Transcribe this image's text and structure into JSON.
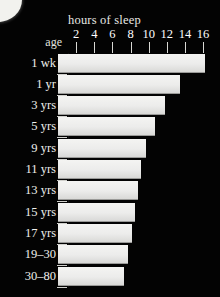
{
  "figure": {
    "title": "hours of sleep",
    "age_axis_label": "age"
  },
  "chart_data": {
    "type": "bar",
    "orientation": "horizontal",
    "title": "hours of sleep",
    "xlabel": "hours of sleep",
    "ylabel": "age",
    "xlim": [
      0,
      17
    ],
    "xticks": [
      2,
      4,
      6,
      8,
      10,
      12,
      14,
      16
    ],
    "xtick_labels": [
      "2",
      "4",
      "6",
      "8",
      "10",
      "12",
      "14",
      "16"
    ],
    "grid": false,
    "legend": "none",
    "categories": [
      "1 wk",
      "1 yr",
      "3 yrs",
      "5 yrs",
      "9 yrs",
      "11 yrs",
      "13 yrs",
      "15 yrs",
      "17 yrs",
      "19–30",
      "30–80"
    ],
    "values": [
      16.2,
      13.5,
      11.8,
      10.7,
      9.7,
      9.2,
      8.8,
      8.5,
      8.2,
      7.7,
      7.3
    ],
    "bar_color": "#ececea",
    "background_color": "#030303",
    "text_color": "#efefeb"
  }
}
